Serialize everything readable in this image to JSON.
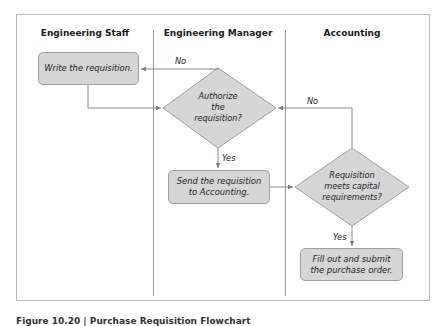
{
  "diagram": {
    "type": "swimlane-flowchart",
    "lanes": [
      {
        "id": "staff",
        "label": "Engineering Staff"
      },
      {
        "id": "manager",
        "label": "Engineering Manager"
      },
      {
        "id": "accounting",
        "label": "Accounting"
      }
    ],
    "nodes": [
      {
        "id": "write",
        "lane": "staff",
        "shape": "process",
        "lines": [
          "Write the requisition."
        ]
      },
      {
        "id": "authorize",
        "lane": "manager",
        "shape": "decision",
        "lines": [
          "Authorize",
          "the",
          "requisition?"
        ]
      },
      {
        "id": "send",
        "lane": "manager",
        "shape": "process",
        "lines": [
          "Send the requisition",
          "to Accounting."
        ]
      },
      {
        "id": "meets",
        "lane": "accounting",
        "shape": "decision",
        "lines": [
          "Requisition",
          "meets capital",
          "requirements?"
        ]
      },
      {
        "id": "fill",
        "lane": "accounting",
        "shape": "process",
        "lines": [
          "Fill out and submit",
          "the purchase order."
        ]
      }
    ],
    "edges": [
      {
        "from": "write",
        "to": "authorize",
        "label": ""
      },
      {
        "from": "authorize",
        "to": "write",
        "label": "No"
      },
      {
        "from": "authorize",
        "to": "send",
        "label": "Yes"
      },
      {
        "from": "send",
        "to": "meets",
        "label": ""
      },
      {
        "from": "meets",
        "to": "authorize",
        "label": "No"
      },
      {
        "from": "meets",
        "to": "fill",
        "label": "Yes"
      }
    ],
    "colors": {
      "node_fill": "#d6d6d6",
      "node_border": "#9f9f9f",
      "line": "#8a8a8a",
      "frame": "#b8b8b8"
    }
  },
  "caption": "Figure 10.20 | Purchase Requisition Flowchart"
}
